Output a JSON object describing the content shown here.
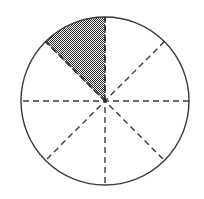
{
  "figure": {
    "title": "Circle divided into eight equal sectors with one sector shaded",
    "background_color": "#ffffff",
    "outline_color": "#3a3a3a",
    "dash_color": "#3a3a3a",
    "shade_color": "#808080",
    "shade_pattern": "50-percent-checker-dither",
    "outline_width": 1.4,
    "dash_width": 1.4,
    "dash_pattern": "6 4"
  },
  "circle": {
    "center_x": 105,
    "center_y": 101,
    "radius": 84,
    "divisions": 8,
    "sector_angle_degrees": 45
  },
  "diameters": [
    {
      "name": "horizontal-diameter",
      "angle_degrees": 0,
      "style": "dashed"
    },
    {
      "name": "diagonal-diameter-45",
      "angle_degrees": 45,
      "style": "dashed"
    },
    {
      "name": "vertical-diameter",
      "angle_degrees": 90,
      "style": "dashed"
    },
    {
      "name": "diagonal-diameter-135",
      "angle_degrees": 135,
      "style": "dashed"
    }
  ],
  "sectors": [
    {
      "index": 0,
      "start_angle": 0,
      "end_angle": 45,
      "shaded": false,
      "fraction": "1/8"
    },
    {
      "index": 1,
      "start_angle": 45,
      "end_angle": 90,
      "shaded": false,
      "fraction": "1/8"
    },
    {
      "index": 2,
      "start_angle": 90,
      "end_angle": 135,
      "shaded": true,
      "fraction": "1/8"
    },
    {
      "index": 3,
      "start_angle": 135,
      "end_angle": 180,
      "shaded": false,
      "fraction": "1/8"
    },
    {
      "index": 4,
      "start_angle": 180,
      "end_angle": 225,
      "shaded": false,
      "fraction": "1/8"
    },
    {
      "index": 5,
      "start_angle": 225,
      "end_angle": 270,
      "shaded": false,
      "fraction": "1/8"
    },
    {
      "index": 6,
      "start_angle": 270,
      "end_angle": 315,
      "shaded": false,
      "fraction": "1/8"
    },
    {
      "index": 7,
      "start_angle": 315,
      "end_angle": 360,
      "shaded": false,
      "fraction": "1/8"
    }
  ],
  "shaded_summary": {
    "count": 1,
    "total": 8,
    "fraction_shaded": "1/8",
    "percent_shaded": 12.5
  },
  "labels": []
}
